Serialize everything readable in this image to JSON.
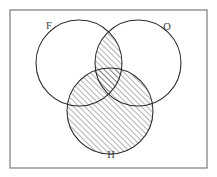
{
  "figure": {
    "frame": {
      "x": 10,
      "y": 10,
      "width": 197,
      "height": 158,
      "stroke_color": "#6d6f74"
    },
    "background_color": "#ffffff",
    "line_color": "#2b2b2b",
    "hatch_color": "#4a4a4a",
    "hatch_direction": "forward-slash-45-degrees"
  },
  "sets": [
    {
      "id": "F",
      "label": "F",
      "label_x": 49,
      "label_y": 27,
      "center_x": 79,
      "center_y": 63,
      "radius": 43
    },
    {
      "id": "O",
      "label": "O",
      "label_x": 167,
      "label_y": 28,
      "center_x": 138,
      "center_y": 63,
      "radius": 43
    },
    {
      "id": "H",
      "label": "H",
      "label_x": 111,
      "label_y": 156,
      "center_x": 110,
      "center_y": 111,
      "radius": 43
    }
  ],
  "shading": {
    "description": "Shaded region is H union (F intersect O)",
    "regions": [
      "H",
      "F-intersect-O"
    ]
  },
  "chart_data": {
    "type": "diagram",
    "subtype": "venn-3-set",
    "sets": [
      "F",
      "O",
      "H"
    ],
    "shaded_expression": "H ∪ (F ∩ O)",
    "shaded_regions": [
      "F ∩ O ∩ H'",
      "F ∩ O ∩ H",
      "F ∩ O' ∩ H",
      "F' ∩ O ∩ H",
      "F' ∩ O' ∩ H"
    ],
    "unshaded_regions": [
      "F ∩ O' ∩ H'",
      "F' ∩ O ∩ H'",
      "F' ∩ O' ∩ H'"
    ],
    "geometry": {
      "frame": [
        10,
        10,
        197,
        158
      ],
      "circles": [
        {
          "label": "F",
          "cx": 79,
          "cy": 63,
          "r": 43
        },
        {
          "label": "O",
          "cx": 138,
          "cy": 63,
          "r": 43
        },
        {
          "label": "H",
          "cx": 110,
          "cy": 111,
          "r": 43
        }
      ]
    },
    "legend_position": "none",
    "grid": false
  }
}
